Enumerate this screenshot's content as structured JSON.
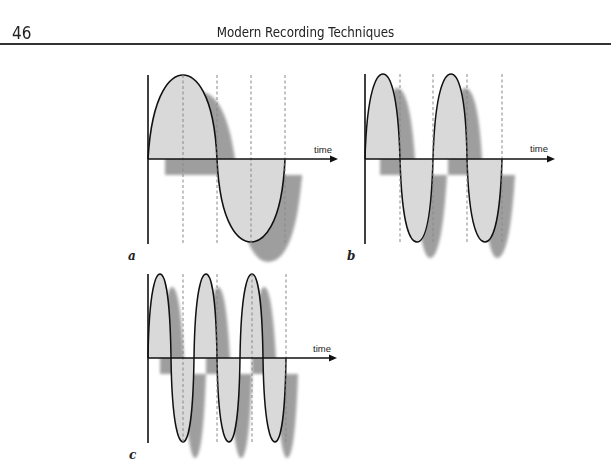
{
  "header": {
    "page_number": "46",
    "running_title": "Modern Recording Techniques"
  },
  "figure": {
    "panels": [
      {
        "id": "a",
        "label": "a",
        "axis_label": "time",
        "cycles": 1,
        "description": "low frequency sine wave, one cycle"
      },
      {
        "id": "b",
        "label": "b",
        "axis_label": "time",
        "cycles": 2,
        "description": "sine wave, two cycles (double frequency)"
      },
      {
        "id": "c",
        "label": "c",
        "axis_label": "time",
        "cycles": 3,
        "description": "sine wave, three cycles (triple frequency)"
      }
    ],
    "colors": {
      "wave_fill": "#d8d8d8",
      "wave_stroke": "#111111",
      "shadow": "#8a8a8a",
      "axis": "#111111",
      "dashed_guide": "#888888"
    }
  }
}
